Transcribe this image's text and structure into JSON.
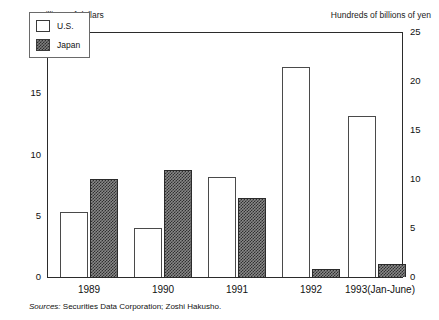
{
  "chart_data": {
    "type": "bar",
    "title": "",
    "subtitle": "",
    "categories": [
      "1989",
      "1990",
      "1991",
      "1992",
      "1993(Jan-June)"
    ],
    "series": [
      {
        "name": "U.S.",
        "axis": "left",
        "unit": "Billions of dollars",
        "values": [
          5.3,
          4.0,
          8.2,
          17.2,
          13.2
        ]
      },
      {
        "name": "Japan",
        "axis": "right",
        "unit": "Hundreds of billions of yen",
        "values": [
          10.0,
          11.0,
          8.1,
          0.8,
          1.3
        ]
      }
    ],
    "left_axis": {
      "label": "Billions of dollars",
      "ticks": [
        "0",
        "5",
        "10",
        "15",
        "20"
      ],
      "tick_values": [
        0,
        5,
        10,
        15,
        20
      ],
      "ylim": [
        0,
        20
      ]
    },
    "right_axis": {
      "label": "Hundreds of billions of yen",
      "ticks": [
        "0",
        "5",
        "10",
        "15",
        "20",
        "25"
      ],
      "tick_values": [
        0,
        5,
        10,
        15,
        20,
        25
      ],
      "ylim": [
        0,
        25
      ]
    },
    "xlabel": "",
    "grid": false,
    "legend": {
      "position": "top-left",
      "entries": [
        {
          "label": "U.S.",
          "swatch": "open-white-box"
        },
        {
          "label": "Japan",
          "swatch": "crosshatch-gray-box"
        }
      ]
    },
    "annotations": []
  },
  "axis_captions": {
    "left": "Billions of dollars",
    "right": "Hundreds of billions of yen"
  },
  "source_note": {
    "prefix": "Sources:",
    "text": "Securities Data Corporation; Zoshi Hakusho."
  },
  "colors": {
    "frame": "#2b2b2b",
    "us_fill": "#ffffff",
    "us_stroke": "#4a4a4a",
    "japan_fill": "#888888",
    "japan_pattern": "#303030",
    "text": "#111111",
    "background": "#ffffff"
  }
}
